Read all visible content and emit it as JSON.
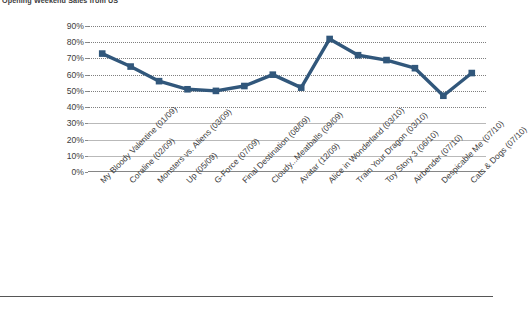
{
  "chart_data": {
    "type": "line",
    "title": "Opening Weekend Sales from US",
    "xlabel": "",
    "ylabel": "",
    "ylim": [
      0,
      0.9
    ],
    "ytick_labels": [
      "90%",
      "80%",
      "70%",
      "60%",
      "50%",
      "40%",
      "30%",
      "20%",
      "10%",
      "0%"
    ],
    "ytick_values": [
      0.9,
      0.8,
      0.7,
      0.6,
      0.5,
      0.4,
      0.3,
      0.2,
      0.1,
      0.0
    ],
    "grid": true,
    "legend": "none",
    "series_color": "#31577B",
    "marker": "square",
    "categories": [
      "My Bloody Valentine (01/09)",
      "Coraline (02/09)",
      "Monsters vs. Aliens (03/09)",
      "Up (05/09)",
      "G-Force (07/09)",
      "Final Destination (08/09)",
      "Cloudy...Meatballs (09/09)",
      "Avatar (12/09)",
      "Alice in Wonderland (03/10)",
      "Train Your Dragon (03/10)",
      "Toy Story 3 (06/10)",
      "Airbender (07/10)",
      "Despicable Me (07/10)",
      "Cats & Dogs (07/10)"
    ],
    "values": [
      0.73,
      0.65,
      0.56,
      0.51,
      0.5,
      0.53,
      0.6,
      0.52,
      0.82,
      0.72,
      0.69,
      0.64,
      0.47,
      0.61
    ],
    "value_labels": [
      "73%",
      "65%",
      "56%",
      "51%",
      "50%",
      "53%",
      "60%",
      "52%",
      "82%",
      "72%",
      "69%",
      "64%",
      "47%",
      "61%"
    ]
  }
}
